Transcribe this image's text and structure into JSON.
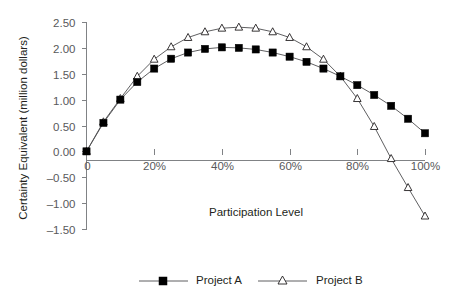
{
  "chart_data": {
    "type": "line",
    "title": "",
    "xlabel": "Participation Level",
    "ylabel": "Certainty Equivalent (million dollars)",
    "x": [
      0,
      5,
      10,
      15,
      20,
      25,
      30,
      35,
      40,
      45,
      50,
      55,
      60,
      65,
      70,
      75,
      80,
      85,
      90,
      95,
      100
    ],
    "xtick_labels": [
      "0",
      "20%",
      "40%",
      "60%",
      "80%",
      "100%"
    ],
    "xtick_values": [
      0,
      20,
      40,
      60,
      80,
      100
    ],
    "xlim": [
      0,
      100
    ],
    "ytick_labels": [
      "2.50",
      "2.00",
      "1.50",
      "1.00",
      "0.50",
      "0.00",
      "-0.50",
      "-1.00",
      "-1.50"
    ],
    "ytick_values": [
      2.5,
      2.0,
      1.5,
      1.0,
      0.5,
      0.0,
      -0.5,
      -1.0,
      -1.5
    ],
    "ylim": [
      -1.5,
      2.5
    ],
    "grid": false,
    "legend_position": "bottom",
    "series": [
      {
        "name": "Project A",
        "marker": "filled-square",
        "values": [
          0.0,
          0.55,
          1.0,
          1.34,
          1.6,
          1.79,
          1.91,
          1.98,
          2.01,
          2.0,
          1.97,
          1.91,
          1.83,
          1.73,
          1.6,
          1.45,
          1.28,
          1.09,
          0.88,
          0.63,
          0.35
        ]
      },
      {
        "name": "Project B",
        "marker": "open-triangle",
        "values": [
          0.0,
          0.57,
          1.02,
          1.45,
          1.78,
          2.02,
          2.2,
          2.31,
          2.38,
          2.4,
          2.38,
          2.31,
          2.2,
          2.02,
          1.78,
          1.45,
          1.02,
          0.48,
          -0.14,
          -0.7,
          -1.25
        ]
      }
    ]
  },
  "legend": {
    "items": [
      {
        "label": "Project A"
      },
      {
        "label": "Project B"
      }
    ]
  },
  "axes": {
    "x_title": "Participation Level",
    "y_title": "Certainty Equivalent (million dollars)"
  }
}
